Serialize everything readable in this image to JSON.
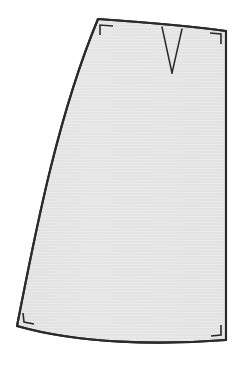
{
  "illustration": {
    "title": "A-line Skirt Panel",
    "type": "technical-flat-pattern-drawing",
    "caption": "",
    "canvas": {
      "width": 240,
      "height": 367,
      "background_color": "#ffffff"
    },
    "style": {
      "outline_color": "#2b2b2b",
      "outline_width": 2.1,
      "fill_base_color": "#e2e2e2",
      "fill_highlight_color": "#eeeeee",
      "fill_texture": "horizontal-hairlines",
      "dart_line_color": "#2b2b2b",
      "dart_line_width": 1.5,
      "corner_mark_color": "#2b2b2b",
      "corner_mark_width": 1.6
    },
    "shapes": {
      "garment_body": {
        "name": "skirt-panel-body",
        "description": "A-line skirt panel: narrow slightly-curved waist at top, straight right side seam, strongly flared curved left side seam, gently curved hem at bottom.",
        "path": "M 98,19 C 140,22 190,26 226,31 L 226,340 C 160,345 80,344 17,326 C 34,240 56,120 98,19 Z"
      },
      "waist_edge": {
        "name": "waist-edge",
        "description": "Top waistline, slopes down slightly left-to-right with a subtle curve.",
        "path": "M 98,19 C 140,22 190,26 226,31"
      },
      "right_side_seam": {
        "name": "right-side-seam",
        "description": "Right side seam, essentially vertical and straight.",
        "path": "M 226,31 L 226,340"
      },
      "hem_edge": {
        "name": "hem-edge",
        "description": "Bottom hemline, gently curved, dipping lower toward the left.",
        "path": "M 226,340 C 160,345 80,344 17,326"
      },
      "left_side_seam": {
        "name": "left-side-seam",
        "description": "Left side seam flaring outward, a long convex curve from the waist down to the hem.",
        "path": "M 17,326 C 34,240 56,120 98,19"
      },
      "dart": {
        "name": "waist-dart",
        "description": "V-shaped waist dart opening at the waistline and tapering to a point.",
        "left_leg": "M 162,27 L 172,73",
        "right_leg": "M 182,29 L 172,73",
        "apex": {
          "x": 172,
          "y": 73
        },
        "opening_left": {
          "x": 162,
          "y": 27
        },
        "opening_right": {
          "x": 182,
          "y": 29
        },
        "width_at_waist": 20,
        "depth": 46
      }
    },
    "corner_marks": [
      {
        "name": "corner-mark-top-left",
        "position": "top-left",
        "description": "Right-angle seam allowance tick at the top-left waist corner.",
        "path": "M 100,35 L 100,25 L 113,26"
      },
      {
        "name": "corner-mark-top-right",
        "position": "top-right",
        "description": "Right-angle seam allowance tick at the top-right waist corner.",
        "path": "M 210,33 L 221,34 L 221,44"
      },
      {
        "name": "corner-mark-bottom-left",
        "position": "bottom-left",
        "description": "Right-angle seam allowance tick at the bottom-left hem corner.",
        "path": "M 23,313 L 24,322 L 34,324"
      },
      {
        "name": "corner-mark-bottom-right",
        "position": "bottom-right",
        "description": "Right-angle seam allowance tick at the bottom-right hem corner.",
        "path": "M 221,325 L 221,335 L 211,336"
      }
    ]
  }
}
